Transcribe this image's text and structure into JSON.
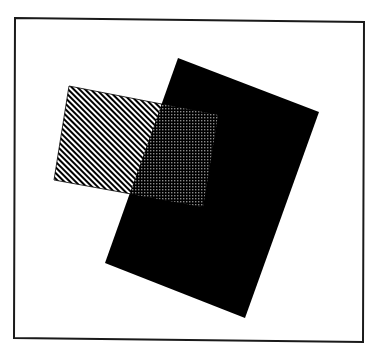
{
  "figure": {
    "description": "Two overlapping rotated rectangles inside a square frame",
    "canvas": {
      "width": 373,
      "height": 352,
      "background": "#ffffff"
    },
    "frame": {
      "points": [
        [
          15,
          18
        ],
        [
          364,
          22
        ],
        [
          363,
          342
        ],
        [
          14,
          338
        ]
      ],
      "stroke": "#1a1a1a",
      "stroke_width": 2
    },
    "shapes": [
      {
        "id": "black-rectangle",
        "fill": "#000000",
        "points": [
          [
            178,
            58
          ],
          [
            319,
            112
          ],
          [
            245,
            318
          ],
          [
            105,
            263
          ]
        ]
      },
      {
        "id": "hatched-rectangle",
        "pattern": "diagonal-stripes",
        "stripe_color": "#000000",
        "background": "#ffffff",
        "stripe_period": 4,
        "points": [
          [
            69,
            86
          ],
          [
            218,
            115
          ],
          [
            203,
            207
          ],
          [
            54,
            180
          ]
        ]
      }
    ],
    "overlap": {
      "id": "overlap-region",
      "pattern": "checkerboard",
      "dot_color": "#8a8a8a",
      "background": "#000000"
    }
  }
}
